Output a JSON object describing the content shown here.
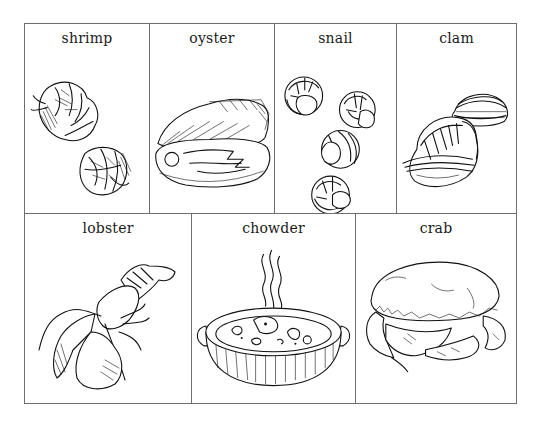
{
  "worksheet": {
    "rows": [
      {
        "cells": [
          {
            "label": "shrimp",
            "icon": "shrimp-illustration"
          },
          {
            "label": "oyster",
            "icon": "oyster-illustration"
          },
          {
            "label": "snail",
            "icon": "snail-illustration"
          },
          {
            "label": "clam",
            "icon": "clam-illustration"
          }
        ]
      },
      {
        "cells": [
          {
            "label": "lobster",
            "icon": "lobster-illustration"
          },
          {
            "label": "chowder",
            "icon": "chowder-illustration"
          },
          {
            "label": "crab",
            "icon": "crab-illustration"
          }
        ]
      }
    ],
    "colors": {
      "border": "#6e6e6e",
      "ink": "#111111",
      "background": "#ffffff"
    }
  }
}
